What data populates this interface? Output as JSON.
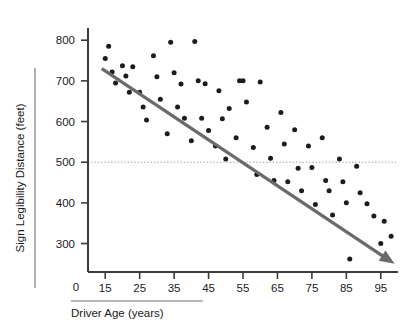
{
  "chart_data": {
    "type": "scatter",
    "title": "",
    "xlabel": "Driver Age (years)",
    "ylabel": "Sign Legibility Distance (feet)",
    "xlim": [
      10,
      100
    ],
    "ylim": [
      230,
      830
    ],
    "x_ticks": [
      15,
      25,
      35,
      45,
      55,
      65,
      75,
      85,
      95
    ],
    "x_tick_labels": [
      "15",
      "25",
      "35",
      "45",
      "55",
      "65",
      "75",
      "85",
      "95"
    ],
    "y_ticks": [
      300,
      400,
      500,
      600,
      700,
      800
    ],
    "y_tick_labels": [
      "300",
      "400",
      "500",
      "600",
      "700",
      "800"
    ],
    "origin_label": "0",
    "grid": false,
    "legend": null,
    "reference_line": {
      "axis": "y",
      "value": 500,
      "style": "dotted",
      "color": "#9a9aa5"
    },
    "trend_line": {
      "style": "solid-arrow",
      "color": "#6a6a6a",
      "x_start": 14,
      "y_start": 730,
      "x_end": 99,
      "y_end": 250,
      "slope": -5.65,
      "intercept": 809
    },
    "points": [
      {
        "x": 15,
        "y": 755
      },
      {
        "x": 16,
        "y": 785
      },
      {
        "x": 17,
        "y": 722
      },
      {
        "x": 18,
        "y": 695
      },
      {
        "x": 20,
        "y": 737
      },
      {
        "x": 21,
        "y": 712
      },
      {
        "x": 22,
        "y": 672
      },
      {
        "x": 23,
        "y": 735
      },
      {
        "x": 25,
        "y": 672
      },
      {
        "x": 26,
        "y": 636
      },
      {
        "x": 27,
        "y": 604
      },
      {
        "x": 29,
        "y": 762
      },
      {
        "x": 30,
        "y": 710
      },
      {
        "x": 31,
        "y": 655
      },
      {
        "x": 33,
        "y": 570
      },
      {
        "x": 34,
        "y": 795
      },
      {
        "x": 35,
        "y": 720
      },
      {
        "x": 36,
        "y": 636
      },
      {
        "x": 37,
        "y": 692
      },
      {
        "x": 38,
        "y": 608
      },
      {
        "x": 40,
        "y": 553
      },
      {
        "x": 41,
        "y": 797
      },
      {
        "x": 42,
        "y": 700
      },
      {
        "x": 43,
        "y": 608
      },
      {
        "x": 44,
        "y": 693
      },
      {
        "x": 45,
        "y": 578
      },
      {
        "x": 47,
        "y": 540
      },
      {
        "x": 48,
        "y": 676
      },
      {
        "x": 49,
        "y": 607
      },
      {
        "x": 50,
        "y": 508
      },
      {
        "x": 51,
        "y": 632
      },
      {
        "x": 53,
        "y": 560
      },
      {
        "x": 54,
        "y": 700
      },
      {
        "x": 55,
        "y": 700
      },
      {
        "x": 56,
        "y": 648
      },
      {
        "x": 58,
        "y": 536
      },
      {
        "x": 59,
        "y": 470
      },
      {
        "x": 60,
        "y": 697
      },
      {
        "x": 62,
        "y": 586
      },
      {
        "x": 63,
        "y": 510
      },
      {
        "x": 64,
        "y": 455
      },
      {
        "x": 66,
        "y": 622
      },
      {
        "x": 67,
        "y": 545
      },
      {
        "x": 68,
        "y": 452
      },
      {
        "x": 70,
        "y": 580
      },
      {
        "x": 71,
        "y": 485
      },
      {
        "x": 72,
        "y": 430
      },
      {
        "x": 74,
        "y": 540
      },
      {
        "x": 75,
        "y": 487
      },
      {
        "x": 76,
        "y": 396
      },
      {
        "x": 78,
        "y": 560
      },
      {
        "x": 79,
        "y": 455
      },
      {
        "x": 80,
        "y": 430
      },
      {
        "x": 81,
        "y": 370
      },
      {
        "x": 83,
        "y": 508
      },
      {
        "x": 84,
        "y": 452
      },
      {
        "x": 85,
        "y": 400
      },
      {
        "x": 86,
        "y": 262
      },
      {
        "x": 88,
        "y": 490
      },
      {
        "x": 89,
        "y": 425
      },
      {
        "x": 91,
        "y": 398
      },
      {
        "x": 93,
        "y": 368
      },
      {
        "x": 95,
        "y": 300
      },
      {
        "x": 96,
        "y": 355
      },
      {
        "x": 98,
        "y": 318
      }
    ]
  },
  "labels": {
    "x_axis_title": "Driver Age (years)",
    "y_axis_title": "Sign Legibility Distance (feet)",
    "origin": "0"
  }
}
